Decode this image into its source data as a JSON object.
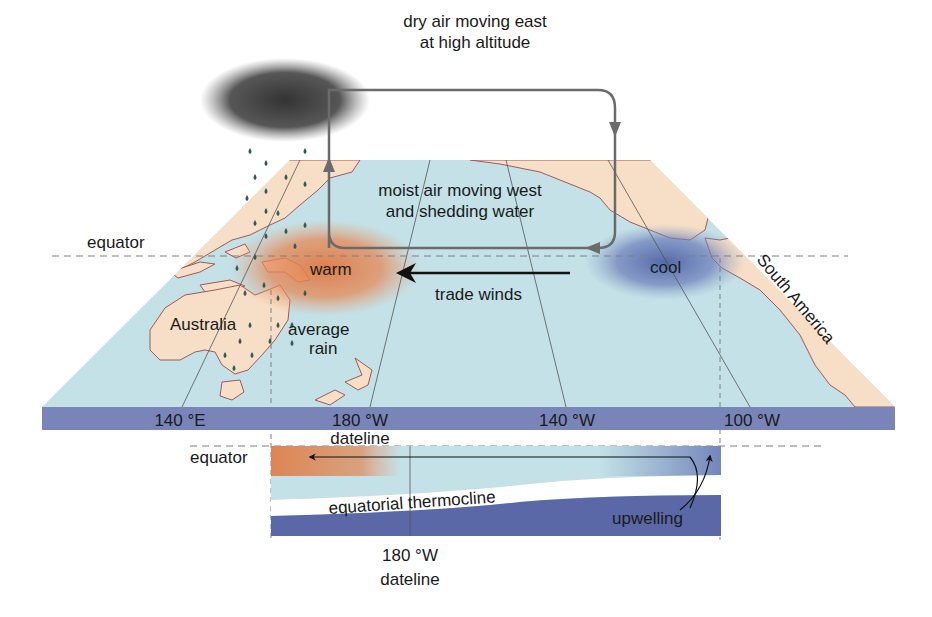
{
  "diagram": {
    "type": "walker-circulation-normal-conditions",
    "colors": {
      "ocean": "#c3e1e6",
      "land": "#f6dfc6",
      "coast": "#a0595a",
      "warm": "#e07a44",
      "cool": "#5a6fae",
      "band": "#7985b8",
      "cloud": "#3a3a3a",
      "arrow_gray": "#6b6b6b",
      "arrow_black": "#111111",
      "raindrop": "#2f5a55",
      "dashed": "#808080"
    },
    "labels": {
      "upper_air": [
        "dry air moving east",
        "at high altitude"
      ],
      "lower_air": [
        "moist air moving west",
        "and shedding water"
      ],
      "equator_top": "equator",
      "warm": "warm",
      "cool": "cool",
      "trade_winds": "trade winds",
      "australia": "Australia",
      "average_rain": [
        "average",
        "rain"
      ],
      "south_america": "South America",
      "equator_bottom": "equator",
      "thermocline": "equatorial thermocline",
      "upwelling": "upwelling",
      "dateline_band": "dateline",
      "bottom_longitude": "180 °W",
      "bottom_dateline": "dateline"
    },
    "longitude_ticks": [
      {
        "label": "140 °E",
        "x": 180
      },
      {
        "label": "180 °W",
        "x": 360
      },
      {
        "label": "140 °W",
        "x": 567
      },
      {
        "label": "100 °W",
        "x": 752
      }
    ]
  }
}
